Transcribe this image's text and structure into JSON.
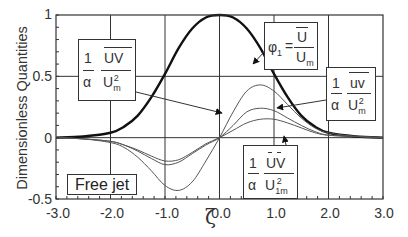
{
  "chart_data": {
    "type": "line",
    "title": "",
    "xlabel": "ζ",
    "ylabel": "Dimensionless Quantities",
    "xlim": [
      -3.0,
      3.0
    ],
    "ylim": [
      -0.5,
      1.0
    ],
    "x_ticks": [
      "-3.0",
      "-2.0",
      "-1.0",
      "0.0",
      "1.0",
      "2.0",
      "3.0"
    ],
    "y_ticks": [
      "1",
      "0.5",
      "0",
      "-0.5"
    ],
    "grid": true,
    "annotation_box": "Free jet",
    "x": [
      -3.0,
      -2.5,
      -2.0,
      -1.75,
      -1.5,
      -1.25,
      -1.0,
      -0.75,
      -0.5,
      -0.25,
      0.0,
      0.25,
      0.5,
      0.75,
      1.0,
      1.25,
      1.5,
      1.75,
      2.0,
      2.5,
      3.0
    ],
    "series": [
      {
        "name": "φ1 = Ū/Um",
        "style": "thick",
        "values": [
          0.0,
          0.01,
          0.04,
          0.09,
          0.18,
          0.33,
          0.52,
          0.73,
          0.89,
          0.98,
          1.0,
          0.98,
          0.89,
          0.73,
          0.52,
          0.33,
          0.18,
          0.09,
          0.04,
          0.01,
          0.0
        ]
      },
      {
        "name": "(1/α) ŪV̄/Um² (upper)",
        "style": "thin",
        "values": [
          0.0,
          -0.01,
          -0.03,
          -0.06,
          -0.11,
          -0.17,
          -0.22,
          -0.2,
          -0.13,
          -0.06,
          0.0,
          0.1,
          0.21,
          0.24,
          0.22,
          0.16,
          0.1,
          0.05,
          0.02,
          0.01,
          0.0
        ]
      },
      {
        "name": "(1/α) uv/Um²",
        "style": "thin",
        "values": [
          0.0,
          -0.01,
          -0.03,
          -0.06,
          -0.1,
          -0.15,
          -0.19,
          -0.18,
          -0.12,
          -0.05,
          0.0,
          0.06,
          0.12,
          0.15,
          0.15,
          0.12,
          0.08,
          0.04,
          0.02,
          0.01,
          0.0
        ]
      },
      {
        "name": "(1/α) ŪV̄/U1m²",
        "style": "thin",
        "values": [
          0.0,
          -0.01,
          -0.04,
          -0.08,
          -0.16,
          -0.27,
          -0.39,
          -0.43,
          -0.36,
          -0.19,
          0.0,
          0.21,
          0.38,
          0.43,
          0.38,
          0.27,
          0.16,
          0.08,
          0.04,
          0.01,
          0.0
        ]
      }
    ],
    "legend": [
      "(1/α) UV/Um² (overbar)",
      "φ1 = Ū/Um",
      "(1/α) uv/Um² (overbar)",
      "(1/α) ŪV̄/U1m²"
    ]
  },
  "labels": {
    "ylabel": "Dimensionless Quantities",
    "xlabel": "ζ",
    "free_jet": "Free jet",
    "one": "1",
    "alpha": "α",
    "UV": "UV",
    "uv": "uv",
    "U": "U",
    "Um_sub": "m",
    "U1m_sub": "1m",
    "sq": "2",
    "phi": "φ",
    "phi_sub": "1",
    "eq": "="
  },
  "axes": {
    "y_ticks": [
      "1",
      "0.5",
      "0",
      "-0.5"
    ],
    "x_ticks": [
      "-3.0",
      "-2.0",
      "-1.0",
      "0.0",
      "1.0",
      "2.0",
      "3.0"
    ]
  }
}
